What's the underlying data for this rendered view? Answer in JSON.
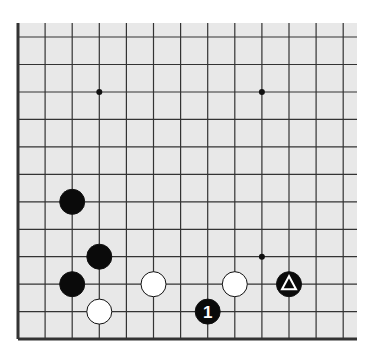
{
  "board": {
    "background": "#e8e8e8",
    "line_color": "#333333",
    "columns_x": [
      18,
      45.1,
      72.2,
      99.3,
      126.4,
      153.5,
      180.6,
      207.7,
      234.8,
      261.9,
      289,
      316.1,
      343.2
    ],
    "rows_y": [
      37,
      64.5,
      92,
      119.4,
      146.9,
      174.4,
      201.8,
      229.3,
      256.7,
      284.2,
      311.6,
      339
    ],
    "edges": {
      "left": true,
      "bottom": true,
      "top": false,
      "right": false
    },
    "star_points": [
      {
        "col": 3,
        "row": 2
      },
      {
        "col": 9,
        "row": 2
      },
      {
        "col": 9,
        "row": 8
      }
    ]
  },
  "stones": [
    {
      "color": "black",
      "col": 2,
      "row": 6,
      "label": ""
    },
    {
      "color": "black",
      "col": 3,
      "row": 8,
      "label": ""
    },
    {
      "color": "black",
      "col": 2,
      "row": 9,
      "label": ""
    },
    {
      "color": "white",
      "col": 3,
      "row": 10,
      "label": ""
    },
    {
      "color": "white",
      "col": 5,
      "row": 9,
      "label": ""
    },
    {
      "color": "white",
      "col": 8,
      "row": 9,
      "label": ""
    },
    {
      "color": "black",
      "col": 7,
      "row": 10,
      "label": "1"
    },
    {
      "color": "black",
      "col": 10,
      "row": 9,
      "label": "triangle"
    }
  ]
}
